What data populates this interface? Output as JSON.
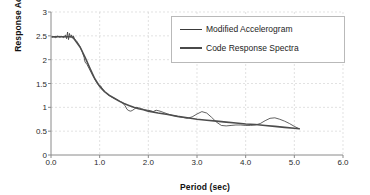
{
  "chart_data": {
    "type": "line",
    "title": "",
    "xlabel": "Period (sec)",
    "ylabel": "Response Acceleration (g)",
    "xlim": [
      0.0,
      6.0
    ],
    "ylim": [
      0,
      3
    ],
    "xticks": [
      "0.0",
      "1.0",
      "2.0",
      "3.0",
      "4.0",
      "5.0",
      "6.0"
    ],
    "xtick_values": [
      0.0,
      1.0,
      2.0,
      3.0,
      4.0,
      5.0,
      6.0
    ],
    "yticks": [
      "0",
      "0.5",
      "1",
      "1.5",
      "2",
      "2.5",
      "3"
    ],
    "ytick_values": [
      0,
      0.5,
      1,
      1.5,
      2,
      2.5,
      3
    ],
    "grid": true,
    "grid_color": "#d6d6d6",
    "legend_position": "upper-right",
    "series": [
      {
        "name": "Modified Accelerogram",
        "color": "#3a3a3a",
        "width": 0.8,
        "x": [
          0.02,
          0.06,
          0.1,
          0.14,
          0.18,
          0.22,
          0.26,
          0.3,
          0.32,
          0.34,
          0.36,
          0.38,
          0.4,
          0.42,
          0.44,
          0.46,
          0.48,
          0.52,
          0.56,
          0.6,
          0.64,
          0.68,
          0.7,
          0.74,
          0.78,
          0.82,
          0.86,
          0.9,
          0.94,
          0.98,
          1.02,
          1.06,
          1.1,
          1.16,
          1.22,
          1.28,
          1.34,
          1.4,
          1.46,
          1.52,
          1.56,
          1.6,
          1.64,
          1.68,
          1.72,
          1.76,
          1.8,
          1.86,
          1.92,
          1.98,
          2.04,
          2.1,
          2.16,
          2.24,
          2.32,
          2.4,
          2.5,
          2.6,
          2.7,
          2.8,
          2.9,
          3.0,
          3.1,
          3.2,
          3.3,
          3.4,
          3.5,
          3.6,
          3.7,
          3.8,
          3.9,
          4.0,
          4.1,
          4.2,
          4.3,
          4.4,
          4.5,
          4.6,
          4.7,
          4.8,
          4.9,
          5.0,
          5.1
        ],
        "y": [
          2.47,
          2.48,
          2.46,
          2.5,
          2.47,
          2.49,
          2.46,
          2.52,
          2.44,
          2.58,
          2.42,
          2.55,
          2.47,
          2.52,
          2.45,
          2.5,
          2.44,
          2.4,
          2.34,
          2.26,
          2.17,
          2.05,
          1.95,
          1.9,
          1.82,
          1.74,
          1.66,
          1.59,
          1.52,
          1.46,
          1.45,
          1.38,
          1.33,
          1.27,
          1.23,
          1.2,
          1.17,
          1.14,
          1.1,
          1.04,
          0.96,
          0.93,
          0.92,
          0.94,
          0.97,
          1.0,
          0.99,
          0.97,
          0.95,
          0.94,
          0.93,
          0.91,
          0.94,
          0.92,
          0.89,
          0.86,
          0.83,
          0.81,
          0.79,
          0.77,
          0.8,
          0.86,
          0.91,
          0.88,
          0.79,
          0.69,
          0.62,
          0.61,
          0.62,
          0.63,
          0.63,
          0.62,
          0.62,
          0.63,
          0.66,
          0.72,
          0.77,
          0.78,
          0.75,
          0.71,
          0.66,
          0.6,
          0.55
        ]
      },
      {
        "name": "Code Response Spectra",
        "color": "#4d4d4d",
        "width": 1.6,
        "x": [
          0.02,
          0.1,
          0.2,
          0.3,
          0.4,
          0.45,
          0.5,
          0.6,
          0.7,
          0.8,
          0.9,
          1.0,
          1.1,
          1.2,
          1.3,
          1.4,
          1.5,
          1.6,
          1.7,
          1.8,
          1.9,
          2.0,
          2.2,
          2.4,
          2.6,
          2.8,
          3.0,
          3.2,
          3.4,
          3.6,
          3.8,
          4.0,
          4.2,
          4.4,
          4.6,
          4.8,
          5.0,
          5.1
        ],
        "y": [
          2.48,
          2.48,
          2.48,
          2.48,
          2.48,
          2.47,
          2.4,
          2.26,
          2.05,
          1.82,
          1.6,
          1.44,
          1.33,
          1.25,
          1.19,
          1.13,
          1.08,
          1.04,
          1.0,
          0.97,
          0.95,
          0.92,
          0.88,
          0.85,
          0.81,
          0.78,
          0.75,
          0.73,
          0.71,
          0.69,
          0.67,
          0.65,
          0.64,
          0.62,
          0.6,
          0.58,
          0.56,
          0.55
        ]
      }
    ]
  },
  "legend": {
    "items": [
      {
        "label": "Modified Accelerogram",
        "style": "thin"
      },
      {
        "label": "Code Response Spectra",
        "style": "thick"
      }
    ]
  }
}
